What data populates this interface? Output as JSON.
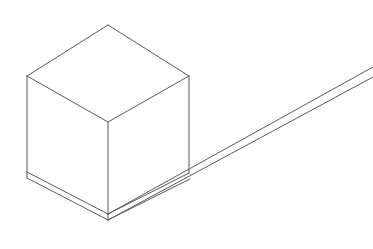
{
  "image": {
    "title": "Isometric wireframe line drawing",
    "subject": "cube resting on a thin inclined board/ramp",
    "background_color": "#ffffff",
    "stroke_color": "#5a5a5a",
    "stroke_width": "1",
    "width": 373,
    "height": 249,
    "style": "technical line art, no fill, thin gray outlines"
  },
  "geometry": {
    "cube": {
      "name": "cube",
      "vertices": {
        "top_back": [
          108,
          25
        ],
        "top_left": [
          27,
          76
        ],
        "top_right": [
          189,
          76
        ],
        "top_front": [
          108,
          122
        ],
        "bottom_left": [
          27,
          172
        ],
        "bottom_front": [
          108,
          214
        ],
        "bottom_right": [
          189,
          172
        ]
      },
      "edges": [
        {
          "name": "top-face-back-left",
          "from": [
            108,
            25
          ],
          "to": [
            27,
            76
          ]
        },
        {
          "name": "top-face-back-right",
          "from": [
            108,
            25
          ],
          "to": [
            189,
            76
          ]
        },
        {
          "name": "top-face-front-left",
          "from": [
            27,
            76
          ],
          "to": [
            108,
            122
          ]
        },
        {
          "name": "top-face-front-right",
          "from": [
            189,
            76
          ],
          "to": [
            108,
            122
          ]
        },
        {
          "name": "vertical-left",
          "from": [
            27,
            76
          ],
          "to": [
            27,
            172
          ]
        },
        {
          "name": "vertical-front",
          "from": [
            108,
            122
          ],
          "to": [
            108,
            214
          ]
        },
        {
          "name": "vertical-right",
          "from": [
            189,
            76
          ],
          "to": [
            189,
            173
          ]
        },
        {
          "name": "bottom-front-left",
          "from": [
            27,
            172
          ],
          "to": [
            108,
            214
          ]
        },
        {
          "name": "bottom-front-right",
          "from": [
            108,
            214
          ],
          "to": [
            189,
            173
          ]
        }
      ]
    },
    "base_slab": {
      "name": "base-slab",
      "description": "thin slab under the cube formed by a second pair of lines offset below the bottom edges",
      "edges": [
        {
          "name": "slab-left-vertical",
          "from": [
            27,
            172
          ],
          "to": [
            27,
            178
          ]
        },
        {
          "name": "slab-bottom-front-left",
          "from": [
            27,
            178
          ],
          "to": [
            108,
            220
          ]
        },
        {
          "name": "slab-front-vertical",
          "from": [
            108,
            214
          ],
          "to": [
            108,
            220
          ]
        },
        {
          "name": "slab-bottom-front-right",
          "from": [
            108,
            220
          ],
          "to": [
            190,
            179
          ]
        }
      ]
    },
    "ramp": {
      "name": "ramp-board",
      "description": "thin board extending from under the cube up toward the upper-right off the canvas",
      "edges": [
        {
          "name": "ramp-top-edge",
          "from": [
            108,
            214
          ],
          "to": [
            373,
            67
          ]
        },
        {
          "name": "ramp-bottom-edge",
          "from": [
            108,
            220
          ],
          "to": [
            373,
            77
          ]
        }
      ]
    }
  },
  "labels": {
    "annotations": []
  }
}
